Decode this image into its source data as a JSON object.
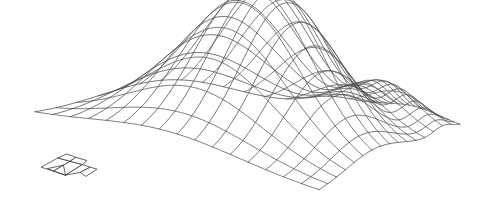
{
  "figure": {
    "title": "",
    "canvas": {
      "width": 489,
      "height": 215,
      "background": "#ffffff"
    },
    "line_color": "#4a4a4a",
    "line_width": 0.75
  },
  "chart_data": {
    "type": "surface",
    "title": "",
    "subtitle": "",
    "xlabel": "",
    "ylabel": "",
    "zlabel": "",
    "grid": true,
    "legend": null,
    "annotations": [],
    "render": "wireframe",
    "shading": "none",
    "surface_function": "gaussian-bump",
    "description": "3D wireframe mesh of a single smooth unimodal peak (bivariate-gaussian-like bump) rising from a flat rectangular base plane, viewed in oblique projection from above-front-left.",
    "nu": 17,
    "nv": 17,
    "x": [
      0,
      1
    ],
    "y": [
      0,
      1
    ],
    "zlim": [
      0,
      1
    ],
    "peak": {
      "u": 0.4,
      "v": 0.46,
      "height": 1.0,
      "sigma_u": 0.2,
      "sigma_v": 0.26
    },
    "secondary_peak": {
      "u": 0.88,
      "v": 0.5,
      "height": 0.2,
      "sigma_u": 0.07,
      "sigma_v": 0.3
    },
    "projection": {
      "corner_back_left": [
        35,
        116
      ],
      "corner_back_right": [
        370,
        104
      ],
      "corner_front_right": [
        460,
        126
      ],
      "corner_front_left": [
        319,
        192
      ],
      "z_scale": 150
    },
    "values_note": "Heights are normalized 0..1; the mesh base plane is z=0 and the single dominant peak reaches z=1."
  },
  "marker": {
    "name": "orientation-glyph",
    "description": "small detached wireframe glyph (arrow/axis indicator patch) at lower-left of the plot",
    "position": [
      41,
      152
    ],
    "width": 56,
    "height": 33
  }
}
